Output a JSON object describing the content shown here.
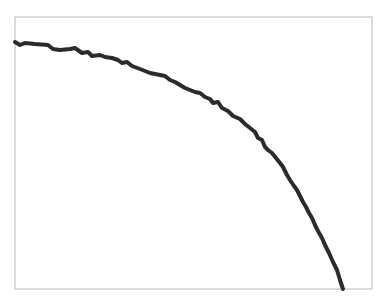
{
  "chart_data": {
    "type": "line",
    "title": "",
    "xlabel": "",
    "ylabel": "",
    "grid": false,
    "legend": null,
    "frame": {
      "left": 15,
      "top": 17,
      "right": 372,
      "bottom": 289
    },
    "colors": {
      "line": "#2b2b2b",
      "frame": "#c4c4c4",
      "background": "#ffffff"
    },
    "x": [
      15,
      20,
      25,
      35,
      48,
      53,
      60,
      70,
      75,
      82,
      88,
      92,
      100,
      105,
      112,
      118,
      122,
      127,
      132,
      140,
      150,
      160,
      165,
      170,
      175,
      180,
      185,
      190,
      195,
      200,
      205,
      210,
      213,
      218,
      222,
      228,
      233,
      240,
      245,
      250,
      255,
      258,
      262,
      265,
      268,
      272,
      276,
      280,
      283,
      287,
      290,
      294,
      297,
      300,
      303,
      306,
      309,
      312,
      315,
      318,
      322,
      325,
      329,
      333,
      337,
      340,
      343
    ],
    "y": [
      42,
      45,
      43,
      44,
      45,
      49,
      50,
      49,
      48,
      53,
      52,
      56,
      55,
      57,
      58,
      60,
      63,
      62,
      66,
      69,
      73,
      75,
      76,
      80,
      82,
      85,
      88,
      90,
      92,
      93,
      97,
      99,
      103,
      102,
      108,
      111,
      116,
      119,
      124,
      128,
      132,
      138,
      140,
      147,
      150,
      153,
      158,
      163,
      167,
      175,
      180,
      186,
      190,
      196,
      202,
      207,
      213,
      218,
      225,
      231,
      238,
      245,
      253,
      262,
      270,
      280,
      289
    ],
    "note": "Pixel coordinates of a single noisy, monotonically decreasing curve (concave-down arc) drawn inside a plain frame with no axis ticks or labels."
  }
}
